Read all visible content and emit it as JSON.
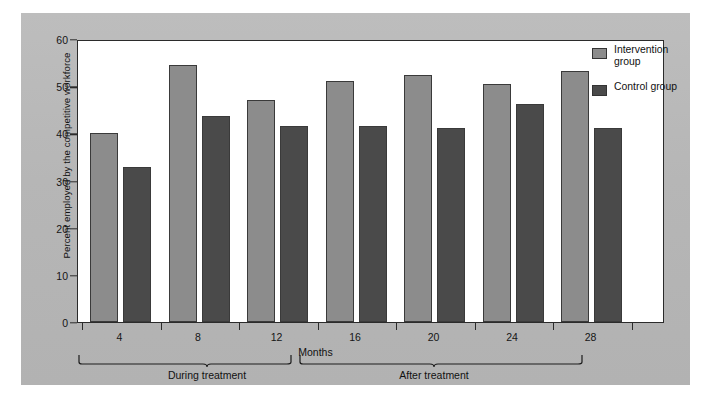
{
  "chart_data": {
    "type": "bar",
    "title": "",
    "xlabel": "Months",
    "ylabel": "Percent employed by the competitive workforce",
    "categories": [
      "4",
      "8",
      "12",
      "16",
      "20",
      "24",
      "28"
    ],
    "series": [
      {
        "name": "Intervention group",
        "color": "#8c8c8c",
        "values": [
          40.0,
          54.5,
          47.0,
          51.0,
          52.3,
          50.4,
          53.3
        ]
      },
      {
        "name": "Control group",
        "color": "#4a4a4a",
        "values": [
          32.8,
          43.7,
          41.5,
          41.5,
          41.2,
          46.3,
          41.2
        ]
      }
    ],
    "ylim": [
      0,
      60
    ],
    "yticks": [
      "0",
      "10",
      "20",
      "30",
      "40",
      "50",
      "60"
    ],
    "xticks": [
      "4",
      "8",
      "12",
      "16",
      "20",
      "24",
      "28"
    ],
    "grid": false,
    "legend_position": "top-right",
    "annotations": [
      {
        "label": "During treatment",
        "span": "4-12"
      },
      {
        "label": "After treatment",
        "span": "16-28"
      }
    ]
  },
  "legend": {
    "items": [
      {
        "label": "Intervention group",
        "color": "#8c8c8c"
      },
      {
        "label": "Control group",
        "color": "#4a4a4a"
      }
    ]
  },
  "axes": {
    "y_label": "Percent employed by the competitive workforce",
    "x_label": "Months"
  },
  "groups": {
    "during": "During treatment",
    "after": "After treatment"
  },
  "colors": {
    "panel_background": "#b9b9b9",
    "plot_background": "#ffffff",
    "axis": "#2b2b2b",
    "intervention": "#8c8c8c",
    "control": "#4a4a4a"
  }
}
